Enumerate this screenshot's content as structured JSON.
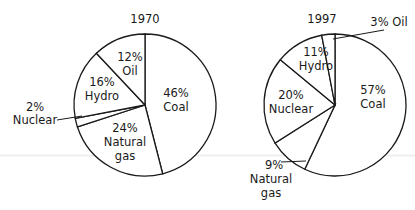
{
  "chart_data": [
    {
      "type": "pie",
      "title": "1970",
      "categories": [
        "Coal",
        "Natural gas",
        "Nuclear",
        "Hydro",
        "Oil"
      ],
      "values": [
        46,
        24,
        2,
        16,
        12
      ],
      "unit": "%",
      "labels": {
        "coal": {
          "pct": "46%",
          "name": "Coal"
        },
        "gas": {
          "pct": "24%",
          "name1": "Natural",
          "name2": "gas"
        },
        "nuclear": {
          "pct": "2%",
          "name": "Nuclear"
        },
        "hydro": {
          "pct": "16%",
          "name": "Hydro"
        },
        "oil": {
          "pct": "12%",
          "name": "Oil"
        }
      }
    },
    {
      "type": "pie",
      "title": "1997",
      "categories": [
        "Coal",
        "Natural gas",
        "Nuclear",
        "Hydro",
        "Oil"
      ],
      "values": [
        57,
        9,
        20,
        11,
        3
      ],
      "unit": "%",
      "labels": {
        "coal": {
          "pct": "57%",
          "name": "Coal"
        },
        "gas": {
          "pct": "9%",
          "name1": "Natural",
          "name2": "gas"
        },
        "nuclear": {
          "pct": "20%",
          "name": "Nuclear"
        },
        "hydro": {
          "pct": "11%",
          "name": "Hydro"
        },
        "oil": {
          "text": "3% Oil"
        }
      }
    }
  ],
  "style": {
    "stroke": "#1a1a1a",
    "fill": "#ffffff"
  }
}
